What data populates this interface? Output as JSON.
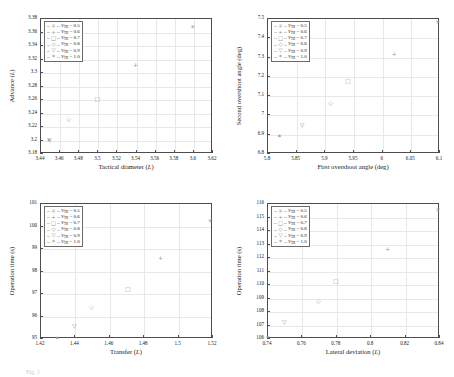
{
  "figure": {
    "caption_fragment": "Fig. 1",
    "top_fragment": ""
  },
  "legend_common": {
    "entries": [
      {
        "marker": "asterisk",
        "glyph": "✳",
        "label_v": "V",
        "label_sub": "TR",
        "label_val": "= 0.5"
      },
      {
        "marker": "plus",
        "glyph": "+",
        "label_v": "V",
        "label_sub": "TR",
        "label_val": "= 0.6"
      },
      {
        "marker": "square",
        "glyph": "□",
        "label_v": "V",
        "label_sub": "TR",
        "label_val": "= 0.7"
      },
      {
        "marker": "diamond",
        "glyph": "◇",
        "label_v": "V",
        "label_sub": "TR",
        "label_val": "= 0.8"
      },
      {
        "marker": "triangle-down",
        "glyph": "▽",
        "label_v": "V",
        "label_sub": "TR",
        "label_val": "= 0.9"
      },
      {
        "marker": "hexagram",
        "glyph": "✶",
        "label_v": "V",
        "label_sub": "TR",
        "label_val": "= 1.0"
      }
    ]
  },
  "chart_data": [
    {
      "id": "panel-advance-vs-tactical-diameter",
      "type": "scatter",
      "title": "",
      "xlabel": "Tactical diameter (L)",
      "ylabel": "Advance (L)",
      "xlim": [
        3.44,
        3.62
      ],
      "ylim": [
        3.18,
        3.38
      ],
      "xticks": [
        "3.44",
        "3.46",
        "3.48",
        "3.5",
        "3.52",
        "3.54",
        "3.56",
        "3.58",
        "3.6",
        "3.62"
      ],
      "yticks": [
        "3.18",
        "3.2",
        "3.22",
        "3.24",
        "3.26",
        "3.28",
        "3.3",
        "3.32",
        "3.34",
        "3.36",
        "3.38"
      ],
      "grid": true,
      "legend_position": "upper-left",
      "points": [
        {
          "series": "V_TR = 0.5",
          "marker": "asterisk",
          "x": 3.6,
          "y": 3.367
        },
        {
          "series": "V_TR = 0.6",
          "marker": "plus",
          "x": 3.54,
          "y": 3.31
        },
        {
          "series": "V_TR = 0.7",
          "marker": "square",
          "x": 3.5,
          "y": 3.26
        },
        {
          "series": "V_TR = 0.8",
          "marker": "diamond",
          "x": 3.47,
          "y": 3.23
        },
        {
          "series": "V_TR = 0.9",
          "marker": "triangle-down",
          "x": 3.45,
          "y": 3.2
        },
        {
          "series": "V_TR = 1.0",
          "marker": "hexagram",
          "x": 3.4495,
          "y": 3.199
        }
      ]
    },
    {
      "id": "panel-second-overshoot-vs-first-overshoot",
      "type": "scatter",
      "title": "",
      "xlabel": "First overshoot angle (deg)",
      "ylabel": "Second overshoot angle (deg)",
      "xlim": [
        5.8,
        6.1
      ],
      "ylim": [
        6.8,
        7.5
      ],
      "xticks": [
        "5.8",
        "5.85",
        "5.9",
        "5.95",
        "6",
        "6.05",
        "6.1"
      ],
      "yticks": [
        "6.8",
        "6.9",
        "7",
        "7.1",
        "7.2",
        "7.3",
        "7.4",
        "7.5"
      ],
      "grid": true,
      "legend_position": "upper-left",
      "points": [
        {
          "series": "V_TR = 0.5",
          "marker": "asterisk",
          "x": 6.098,
          "y": 7.48
        },
        {
          "series": "V_TR = 0.6",
          "marker": "plus",
          "x": 6.022,
          "y": 7.312
        },
        {
          "series": "V_TR = 0.7",
          "marker": "square",
          "x": 5.941,
          "y": 7.175
        },
        {
          "series": "V_TR = 0.8",
          "marker": "diamond",
          "x": 5.911,
          "y": 7.058
        },
        {
          "series": "V_TR = 0.9",
          "marker": "triangle-down",
          "x": 5.861,
          "y": 6.944
        },
        {
          "series": "V_TR = 1.0",
          "marker": "hexagram",
          "x": 5.822,
          "y": 6.888
        }
      ]
    },
    {
      "id": "panel-operation-time-vs-transfer",
      "type": "scatter",
      "title": "",
      "xlabel": "Transfer (L)",
      "ylabel": "Operation time (s)",
      "xlim": [
        1.42,
        1.52
      ],
      "ylim": [
        95,
        101
      ],
      "xticks": [
        "1.42",
        "1.44",
        "1.46",
        "1.48",
        "1.5",
        "1.52"
      ],
      "yticks": [
        "95",
        "96",
        "97",
        "98",
        "99",
        "100",
        "101"
      ],
      "grid": true,
      "legend_position": "upper-left",
      "points": [
        {
          "series": "V_TR = 0.5",
          "marker": "asterisk",
          "x": 1.519,
          "y": 100.2
        },
        {
          "series": "V_TR = 0.6",
          "marker": "plus",
          "x": 1.49,
          "y": 98.55
        },
        {
          "series": "V_TR = 0.7",
          "marker": "square",
          "x": 1.471,
          "y": 97.18
        },
        {
          "series": "V_TR = 0.8",
          "marker": "diamond",
          "x": 1.45,
          "y": 96.4
        },
        {
          "series": "V_TR = 0.9",
          "marker": "triangle-down",
          "x": 1.44,
          "y": 95.52
        },
        {
          "series": "V_TR = 1.0",
          "marker": "hexagram",
          "x": 1.43,
          "y": 95.02
        }
      ]
    },
    {
      "id": "panel-operation-time-vs-lateral-deviation",
      "type": "scatter",
      "title": "",
      "xlabel": "Lateral deviation (L)",
      "ylabel": "Operation time (s)",
      "xlim": [
        0.74,
        0.84
      ],
      "ylim": [
        106,
        116
      ],
      "xticks": [
        "0.74",
        "0.76",
        "0.78",
        "0.8",
        "0.82",
        "0.84"
      ],
      "yticks": [
        "106",
        "107",
        "108",
        "109",
        "110",
        "111",
        "112",
        "113",
        "114",
        "115",
        "116"
      ],
      "grid": true,
      "legend_position": "upper-left",
      "points": [
        {
          "series": "V_TR = 0.5",
          "marker": "asterisk",
          "x": 0.8395,
          "y": 115.45
        },
        {
          "series": "V_TR = 0.6",
          "marker": "plus",
          "x": 0.81,
          "y": 112.6
        },
        {
          "series": "V_TR = 0.7",
          "marker": "square",
          "x": 0.78,
          "y": 110.2
        },
        {
          "series": "V_TR = 0.8",
          "marker": "diamond",
          "x": 0.77,
          "y": 108.75
        },
        {
          "series": "V_TR = 0.9",
          "marker": "triangle-down",
          "x": 0.75,
          "y": 107.2
        },
        {
          "series": "V_TR = 1.0",
          "marker": "hexagram",
          "x": 0.7405,
          "y": 106.05
        }
      ]
    }
  ]
}
